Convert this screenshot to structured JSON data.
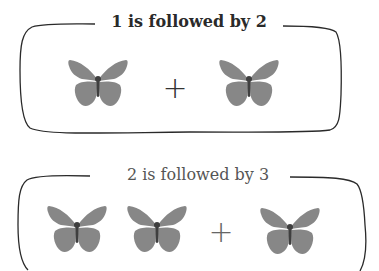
{
  "colors": {
    "butterfly_wing": "#878787",
    "butterfly_body": "#3f3f3f",
    "frame_stroke": "#2a2a2a",
    "title_top": "#2a2a2a",
    "title_bottom": "#555555"
  },
  "panels": [
    {
      "title": "1 is followed by 2",
      "left_group": {
        "count": 1,
        "icon": "butterfly-icon"
      },
      "operator": "+",
      "right_group": {
        "count": 1,
        "icon": "butterfly-icon"
      }
    },
    {
      "title": "2 is followed by 3",
      "left_group": {
        "count": 2,
        "icon": "butterfly-icon"
      },
      "operator": "+",
      "right_group": {
        "count": 1,
        "icon": "butterfly-icon"
      }
    }
  ]
}
